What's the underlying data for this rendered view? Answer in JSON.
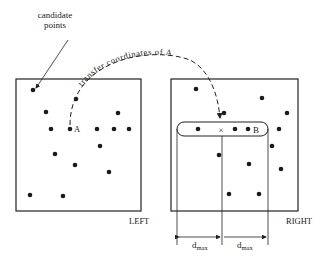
{
  "labels": {
    "candidate_line1": "candidate",
    "candidate_line2": "points",
    "transfer": "transfer coordinates of A",
    "point_a": "A",
    "point_b": "B",
    "cross": "×",
    "left": "LEFT",
    "right": "RIGHT",
    "dmax_left": "d",
    "dmax_right": "d",
    "dmax_sub": "max"
  },
  "left_points": [
    [
      33,
      90
    ],
    [
      76,
      99
    ],
    [
      46,
      112
    ],
    [
      118,
      113
    ],
    [
      51,
      129
    ],
    [
      70,
      129
    ],
    [
      97,
      129
    ],
    [
      114,
      129
    ],
    [
      129,
      129
    ],
    [
      100,
      146
    ],
    [
      55,
      154
    ],
    [
      75,
      165
    ],
    [
      109,
      172
    ],
    [
      30,
      195
    ],
    [
      63,
      196
    ]
  ],
  "right_points": [
    [
      196,
      89
    ],
    [
      262,
      98
    ],
    [
      224,
      113
    ],
    [
      287,
      113
    ],
    [
      198,
      129
    ],
    [
      235,
      129
    ],
    [
      248,
      129
    ],
    [
      279,
      129
    ],
    [
      272,
      146
    ],
    [
      219,
      155
    ],
    [
      249,
      164
    ],
    [
      281,
      169
    ],
    [
      229,
      194
    ],
    [
      259,
      194
    ]
  ]
}
